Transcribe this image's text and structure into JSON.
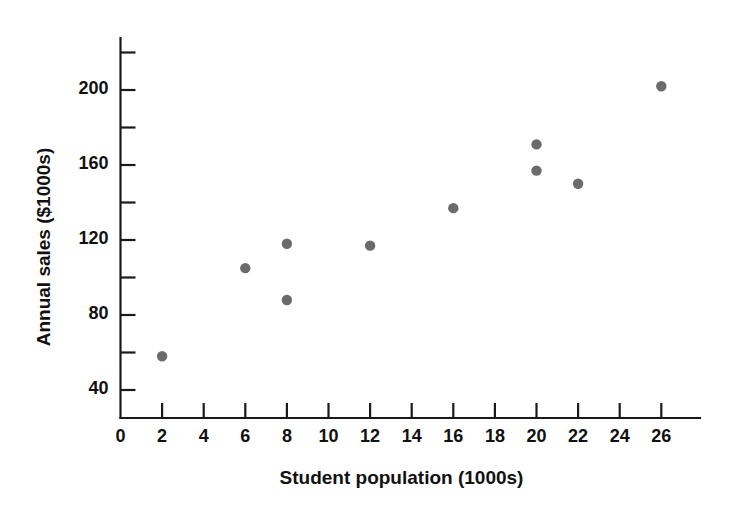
{
  "chart_data": {
    "type": "scatter",
    "title": "",
    "xlabel": "Student population (1000s)",
    "ylabel": "Annual sales ($1000s)",
    "xlim": [
      0,
      27.5
    ],
    "ylim": [
      26,
      226
    ],
    "grid": false,
    "legend": "none",
    "marker_color": "#6b6b6b",
    "axis_color": "#1a1a1a",
    "x_ticks": [
      2,
      4,
      6,
      8,
      10,
      12,
      14,
      16,
      18,
      20,
      22,
      24,
      26
    ],
    "x_tick_labels": [
      "0",
      "2",
      "4",
      "6",
      "8",
      "10",
      "12",
      "14",
      "16",
      "18",
      "20",
      "22",
      "24",
      "26"
    ],
    "y_ticks": [
      40,
      60,
      80,
      100,
      120,
      140,
      160,
      180,
      200,
      220
    ],
    "y_tick_labels": [
      "40",
      "80",
      "120",
      "160",
      "200"
    ],
    "y_labeled_ticks": [
      40,
      80,
      120,
      160,
      200
    ],
    "points": [
      {
        "x": 2,
        "y": 58
      },
      {
        "x": 6,
        "y": 105
      },
      {
        "x": 8,
        "y": 88
      },
      {
        "x": 8,
        "y": 118
      },
      {
        "x": 12,
        "y": 117
      },
      {
        "x": 16,
        "y": 137
      },
      {
        "x": 20,
        "y": 157
      },
      {
        "x": 20,
        "y": 171
      },
      {
        "x": 22,
        "y": 150
      },
      {
        "x": 26,
        "y": 202
      }
    ],
    "series": [
      {
        "name": "Restaurant sales",
        "x": [
          2,
          6,
          8,
          8,
          12,
          16,
          20,
          20,
          22,
          26
        ],
        "values": [
          58,
          105,
          88,
          118,
          117,
          137,
          157,
          171,
          150,
          202
        ]
      }
    ]
  }
}
